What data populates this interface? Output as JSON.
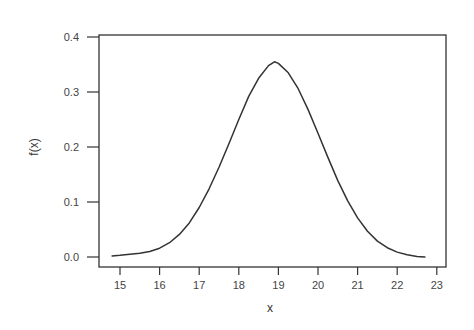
{
  "chart_data": {
    "type": "line",
    "title": "",
    "xlabel": "x",
    "ylabel": "f(x)",
    "xlim": [
      14.5,
      23.2
    ],
    "ylim": [
      -0.02,
      0.405
    ],
    "xticks": [
      15,
      16,
      17,
      18,
      19,
      20,
      21,
      22,
      23
    ],
    "yticks": [
      0.0,
      0.1,
      0.2,
      0.3,
      0.4
    ],
    "xtick_labels": [
      "15",
      "16",
      "17",
      "18",
      "19",
      "20",
      "21",
      "22",
      "23"
    ],
    "ytick_labels": [
      "0.0",
      "0.1",
      "0.2",
      "0.3",
      "0.4"
    ],
    "grid": false,
    "legend": null,
    "series": [
      {
        "name": "f(x)",
        "color": "#333333",
        "x": [
          14.8,
          15.0,
          15.25,
          15.5,
          15.75,
          16.0,
          16.25,
          16.5,
          16.75,
          17.0,
          17.25,
          17.5,
          17.75,
          18.0,
          18.25,
          18.5,
          18.75,
          18.9,
          19.0,
          19.25,
          19.5,
          19.75,
          20.0,
          20.25,
          20.5,
          20.75,
          21.0,
          21.25,
          21.5,
          21.75,
          22.0,
          22.25,
          22.5,
          22.7
        ],
        "y": [
          0.002,
          0.003,
          0.005,
          0.007,
          0.01,
          0.016,
          0.026,
          0.041,
          0.062,
          0.09,
          0.124,
          0.163,
          0.206,
          0.25,
          0.292,
          0.325,
          0.348,
          0.355,
          0.352,
          0.335,
          0.306,
          0.268,
          0.225,
          0.181,
          0.139,
          0.102,
          0.071,
          0.047,
          0.029,
          0.017,
          0.009,
          0.004,
          0.001,
          0.0
        ]
      }
    ]
  }
}
